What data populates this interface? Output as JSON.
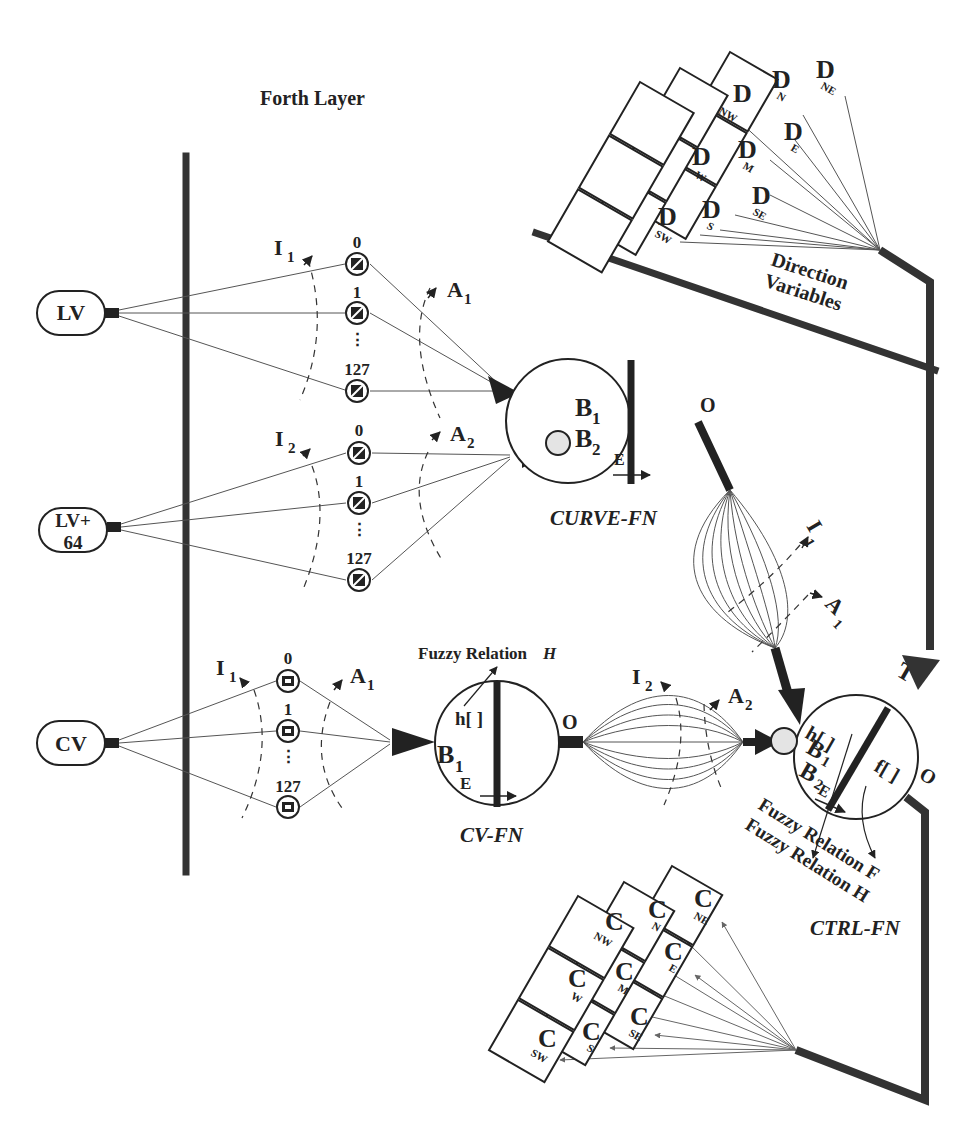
{
  "figure": {
    "top_layer": {
      "title": "Forth Layer",
      "bar_label_line1": "Direction",
      "bar_label_line2": "Variables",
      "cells": [
        {
          "letter": "D",
          "sub": "NW"
        },
        {
          "letter": "D",
          "sub": "N"
        },
        {
          "letter": "D",
          "sub": "NE"
        },
        {
          "letter": "D",
          "sub": "W"
        },
        {
          "letter": "D",
          "sub": "M"
        },
        {
          "letter": "D",
          "sub": "E"
        },
        {
          "letter": "D",
          "sub": "SW"
        },
        {
          "letter": "D",
          "sub": "S"
        },
        {
          "letter": "D",
          "sub": "SE"
        }
      ]
    },
    "inputs": [
      {
        "label": "LV"
      },
      {
        "label_line1": "LV+",
        "label_line2": "64"
      },
      {
        "label": "CV"
      }
    ],
    "neuron_groups": [
      {
        "index_labels": [
          "0",
          "1",
          "⋮",
          "127"
        ],
        "inhibit": {
          "letter": "I",
          "sub": "1"
        },
        "activate": {
          "letter": "A",
          "sub": "1"
        }
      },
      {
        "index_labels": [
          "0",
          "1",
          "⋮",
          "127"
        ],
        "inhibit": {
          "letter": "I",
          "sub": "2"
        },
        "activate": {
          "letter": "A",
          "sub": "2"
        }
      },
      {
        "index_labels": [
          "0",
          "1",
          "⋮",
          "127"
        ],
        "inhibit": {
          "letter": "I",
          "sub": "1"
        },
        "activate": {
          "letter": "A",
          "sub": "1"
        }
      }
    ],
    "curve_fn": {
      "name": "CURVE-FN",
      "b1": {
        "letter": "B",
        "sub": "1"
      },
      "b2": {
        "letter": "B",
        "sub": "2"
      },
      "e": "E",
      "o": "O",
      "out_inhibit": {
        "letter": "I",
        "sub": "1"
      },
      "out_activate": {
        "letter": "A",
        "sub": "1"
      }
    },
    "cv_fn": {
      "name": "CV-FN",
      "relation_label": "Fuzzy Relation",
      "relation_var": "H",
      "h": "h[ ]",
      "b1": {
        "letter": "B",
        "sub": "1"
      },
      "e": "E",
      "o": "O",
      "out_inhibit": {
        "letter": "I",
        "sub": "2"
      },
      "out_activate": {
        "letter": "A",
        "sub": "2"
      }
    },
    "ctrl_fn": {
      "name": "CTRL-FN",
      "t": "T",
      "h": "h[ ]",
      "f": "f[ ]",
      "b1": {
        "letter": "B",
        "sub": "1"
      },
      "b2": {
        "letter": "B",
        "sub": "2"
      },
      "e": "E",
      "o": "O",
      "relation_f": "Fuzzy Relation F",
      "relation_h": "Fuzzy Relation H"
    },
    "output_layer": {
      "cells": [
        {
          "letter": "C",
          "sub": "NW"
        },
        {
          "letter": "C",
          "sub": "N"
        },
        {
          "letter": "C",
          "sub": "NE"
        },
        {
          "letter": "C",
          "sub": "W"
        },
        {
          "letter": "C",
          "sub": "M"
        },
        {
          "letter": "C",
          "sub": "E"
        },
        {
          "letter": "C",
          "sub": "SW"
        },
        {
          "letter": "C",
          "sub": "S"
        },
        {
          "letter": "C",
          "sub": "SE"
        }
      ]
    }
  }
}
